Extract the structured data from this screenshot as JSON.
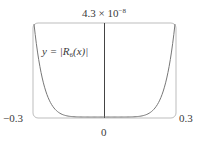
{
  "chart_data": {
    "type": "line",
    "title": "",
    "function_label": "y = |R6(x)|",
    "function_label_parts": {
      "prefix": "y = |R",
      "subscript": "6",
      "suffix": "(x)|"
    },
    "xlabel": "",
    "ylabel": "",
    "xlim": [
      -0.3,
      0.3
    ],
    "ylim": [
      0,
      4.3e-08
    ],
    "x_ticks": [
      "-0.3",
      "0",
      "0.3"
    ],
    "y_max_label": {
      "mantissa": "4.3 × 10",
      "exponent": "−8"
    },
    "grid": false,
    "legend": "none",
    "series": [
      {
        "name": "|R6(x)|",
        "x": [
          -0.3,
          -0.27,
          -0.24,
          -0.21,
          -0.18,
          -0.15,
          -0.12,
          -0.09,
          -0.06,
          -0.03,
          0,
          0.03,
          0.06,
          0.09,
          0.12,
          0.15,
          0.18,
          0.21,
          0.24,
          0.27,
          0.3
        ],
        "values": [
          4.3e-08,
          2.05e-08,
          8.9e-09,
          3.5e-09,
          1.2e-09,
          3.4e-10,
          7e-11,
          9.4e-12,
          5.5e-13,
          4.3e-15,
          0,
          4.3e-15,
          5.5e-13,
          9.4e-12,
          7e-11,
          3.4e-10,
          1.2e-09,
          3.5e-09,
          8.9e-09,
          2.05e-08,
          4.3e-08
        ]
      }
    ]
  },
  "labels": {
    "x_left": "−0.3",
    "x_right": "0.3",
    "x_zero": "0",
    "y_top_mantissa": "4.3 × 10",
    "y_top_exponent": "−8",
    "curve_prefix": "y = |R",
    "curve_sub": "6",
    "curve_suffix": "(x)|"
  },
  "colors": {
    "frame": "#bdbdbd",
    "axis": "#444444",
    "curve": "#777777",
    "text": "#3a3a3a"
  }
}
